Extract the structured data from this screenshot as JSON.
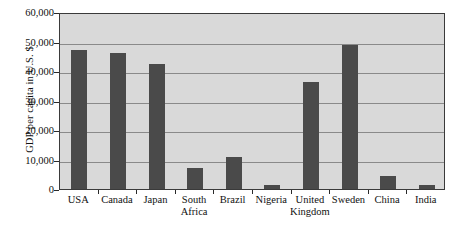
{
  "chart_data": {
    "type": "bar",
    "title": "",
    "xlabel": "",
    "ylabel": "GDP per capita in U.S. $",
    "categories": [
      "USA",
      "Canada",
      "Japan",
      "South Africa",
      "Brazil",
      "Nigeria",
      "United Kingdom",
      "Sweden",
      "China",
      "India"
    ],
    "category_lines": [
      [
        "USA",
        ""
      ],
      [
        "Canada",
        ""
      ],
      [
        "Japan",
        ""
      ],
      [
        "South",
        "Africa"
      ],
      [
        "Brazil",
        ""
      ],
      [
        "Nigeria",
        ""
      ],
      [
        "United",
        "Kingdom"
      ],
      [
        "Sweden",
        ""
      ],
      [
        "China",
        ""
      ],
      [
        "India",
        ""
      ]
    ],
    "values": [
      47000,
      46000,
      42500,
      7000,
      10700,
      1400,
      36200,
      48700,
      4300,
      1400
    ],
    "ylim": [
      0,
      60000
    ],
    "ytick_values": [
      0,
      10000,
      20000,
      30000,
      40000,
      50000,
      60000
    ],
    "ytick_labels": [
      "0",
      "10,000",
      "20,000",
      "30,000",
      "40,000",
      "50,000",
      "60,000"
    ],
    "grid": true,
    "legend": false,
    "bar_color": "#4a4a4a",
    "plot_background": "#d9d9d9",
    "gridline_color": "#8a8a8a",
    "axis_color": "#3a3a3a",
    "page_background": "#ffffff"
  }
}
